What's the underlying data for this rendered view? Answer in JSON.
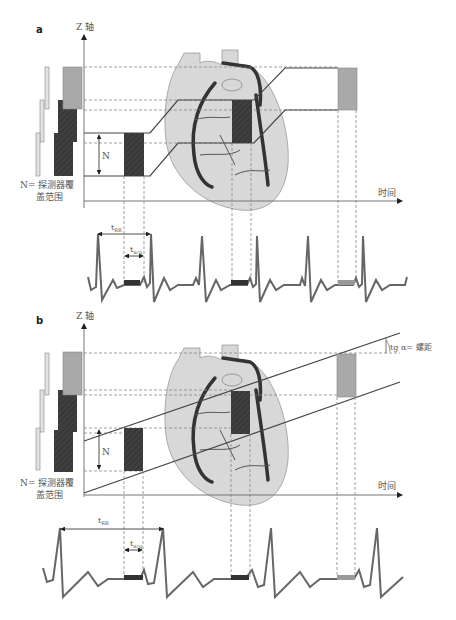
{
  "figure": {
    "colors": {
      "light_block": "#a9a9a9",
      "dark_block": "#3f3f3f",
      "heart_fill": "#d8d8d8",
      "ecg_line": "#666666",
      "axis": "#777777"
    },
    "panels": [
      {
        "id": "a",
        "label": "a",
        "z_axis_label": "Z 轴",
        "time_axis_label": "时间",
        "n_label": "N",
        "n_caption_line1": "N= 探测器覆",
        "n_caption_line2": "盖范围",
        "t_rr_label": "t",
        "t_rr_sub": "RR",
        "t_acq_label": "t",
        "t_acq_sub": "acq",
        "mode": "sequential step-and-shoot"
      },
      {
        "id": "b",
        "label": "b",
        "z_axis_label": "Z 轴",
        "time_axis_label": "时间",
        "n_label": "N",
        "n_caption_line1": "N= 探测器覆",
        "n_caption_line2": "盖范围",
        "pitch_label": "tg α= 螺距",
        "t_rr_label": "t",
        "t_rr_sub": "RR",
        "t_acq_label": "t",
        "t_acq_sub": "acq",
        "mode": "spiral"
      }
    ]
  }
}
